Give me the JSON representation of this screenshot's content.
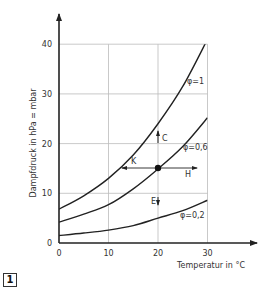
{
  "figure_number": "1",
  "chart_data": {
    "type": "line",
    "title": "",
    "xlabel": "Temperatur in °C",
    "ylabel": "Dampfdruck in hPa = mbar",
    "xlim": [
      0,
      30
    ],
    "ylim": [
      0,
      40
    ],
    "x_ticks": [
      "0",
      "10",
      "20",
      "30"
    ],
    "y_ticks": [
      "0",
      "10",
      "20",
      "30",
      "40"
    ],
    "grid": true,
    "x": [
      0,
      5,
      10,
      15,
      20,
      25,
      30
    ],
    "series": [
      {
        "name": "φ=1",
        "values": [
          6.8,
          9.5,
          13.0,
          17.7,
          24.0,
          31.5,
          41.0
        ]
      },
      {
        "name": "φ=0,6",
        "values": [
          4.2,
          5.8,
          7.7,
          10.9,
          14.9,
          19.4,
          25.2
        ]
      },
      {
        "name": "φ=0,2",
        "values": [
          1.5,
          2.0,
          2.6,
          3.5,
          5.0,
          6.5,
          8.6
        ]
      }
    ],
    "marked_point": {
      "x": 20,
      "y": 15
    },
    "annotations": [
      {
        "label": "C",
        "direction": "up",
        "from": [
          20,
          15
        ],
        "to": [
          20,
          22.4
        ]
      },
      {
        "label": "K",
        "direction": "left",
        "from": [
          20,
          15
        ],
        "to": [
          12.7,
          15
        ]
      },
      {
        "label": "H",
        "direction": "right",
        "from": [
          20,
          15
        ],
        "to": [
          27.6,
          15
        ]
      },
      {
        "label": "E",
        "direction": "down",
        "from": [
          20,
          9.4
        ],
        "to": [
          20,
          7.8
        ]
      }
    ],
    "curve_labels": [
      "φ=1",
      "φ=0,6",
      "φ=0,2"
    ]
  }
}
